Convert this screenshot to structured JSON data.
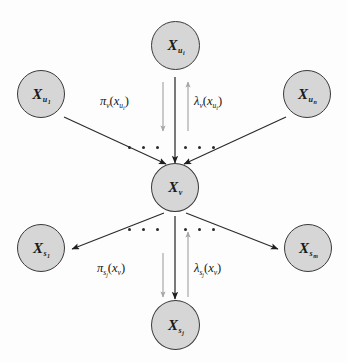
{
  "figure": {
    "name": "bayesian-network-message-passing",
    "background_color": "#fdfdfd",
    "width": 347,
    "height": 363,
    "node_fill": "#d6d6d6",
    "node_stroke": "#3a3a3a",
    "edge_color": "#2a2a2a",
    "message_arrow_color": "#9a9a9a"
  },
  "nodes": {
    "parent_first": {
      "base": "X",
      "sub": "u",
      "subsub": "1"
    },
    "parent_i": {
      "base": "X",
      "sub": "u",
      "subsub": "i"
    },
    "parent_last": {
      "base": "X",
      "sub": "u",
      "subsub": "n"
    },
    "center": {
      "base": "X",
      "sub": "v",
      "subsub": ""
    },
    "child_first": {
      "base": "X",
      "sub": "s",
      "subsub": "1"
    },
    "child_j": {
      "base": "X",
      "sub": "s",
      "subsub": "j"
    },
    "child_last": {
      "base": "X",
      "sub": "s",
      "subsub": "m"
    }
  },
  "messages": {
    "pi_parent": {
      "symbol": "π",
      "sub": "v",
      "subsub": "",
      "arg_open": "(",
      "arg_base": "x",
      "arg_sub": "u",
      "arg_subsub": "i",
      "arg_close": ")",
      "direction": "down"
    },
    "lambda_parent": {
      "symbol": "λ",
      "sub": "v",
      "subsub": "",
      "arg_open": "(",
      "arg_base": "x",
      "arg_sub": "u",
      "arg_subsub": "i",
      "arg_close": ")",
      "direction": "up"
    },
    "pi_child": {
      "symbol": "π",
      "sub": "s",
      "subsub": "j",
      "arg_open": "(",
      "arg_base": "x",
      "arg_sub": "v",
      "arg_subsub": "",
      "arg_close": ")",
      "direction": "down"
    },
    "lambda_child": {
      "symbol": "λ",
      "sub": "s",
      "subsub": "j",
      "arg_open": "(",
      "arg_base": "x",
      "arg_sub": "v",
      "arg_subsub": "",
      "arg_close": ")",
      "direction": "up"
    }
  },
  "ellipses": {
    "upper_left": "• • •",
    "upper_right": "• • •",
    "lower_left": "• • •",
    "lower_right": "• • •"
  }
}
